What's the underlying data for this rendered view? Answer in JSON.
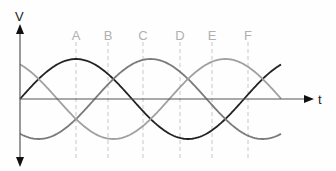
{
  "diagram": {
    "type": "three-phase sine waveform",
    "y_axis_label": "V",
    "x_axis_label": "t",
    "markers": [
      {
        "label": "A",
        "x": 76
      },
      {
        "label": "B",
        "x": 108
      },
      {
        "label": "C",
        "x": 143
      },
      {
        "label": "D",
        "x": 180
      },
      {
        "label": "E",
        "x": 212
      },
      {
        "label": "F",
        "x": 248
      }
    ],
    "curves": [
      {
        "name": "phase-1",
        "color": "#222222",
        "phase_deg": 0
      },
      {
        "name": "phase-2",
        "color": "#7a7a7a",
        "phase_deg": 120
      },
      {
        "name": "phase-3",
        "color": "#a0a0a0",
        "phase_deg": 240
      }
    ],
    "colors": {
      "axis": "#555555",
      "marker_line": "#c8c8c8",
      "marker_text": "#b0b0b0"
    }
  }
}
